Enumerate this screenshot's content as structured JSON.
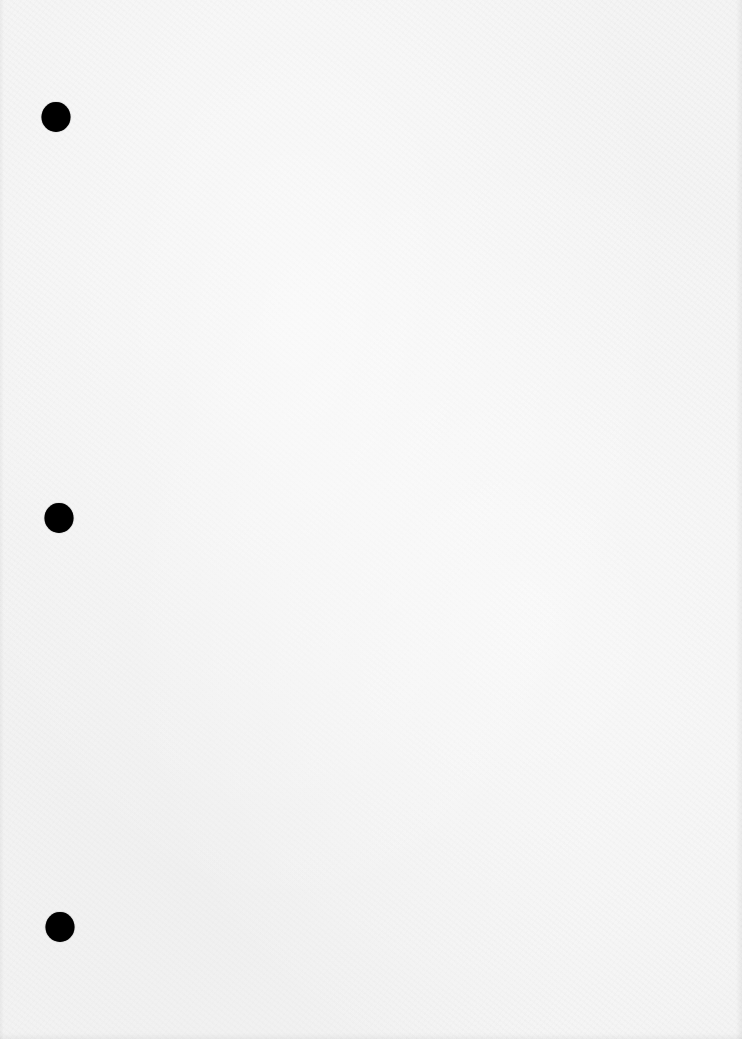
{
  "document": {
    "type": "blank scanned page",
    "background_color": "#f4f4f4",
    "text_content": ""
  },
  "punch_holes": [
    {
      "name": "punch-hole-top",
      "x": 56,
      "y": 117,
      "color": "#000000"
    },
    {
      "name": "punch-hole-middle",
      "x": 59,
      "y": 518,
      "color": "#000000"
    },
    {
      "name": "punch-hole-bottom",
      "x": 60,
      "y": 927,
      "color": "#000000"
    }
  ]
}
